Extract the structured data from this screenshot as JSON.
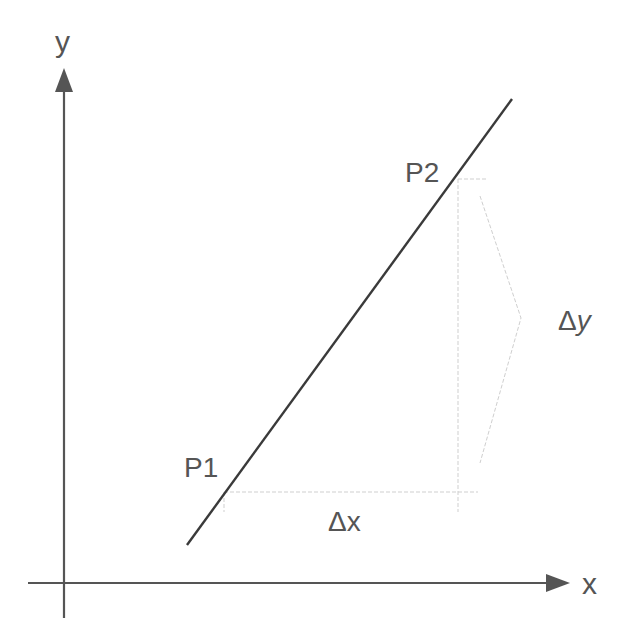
{
  "diagram": {
    "axes": {
      "x_label": "x",
      "y_label": "y"
    },
    "points": [
      {
        "label": "P1"
      },
      {
        "label": "P2"
      }
    ],
    "deltas": {
      "dx_label": "Δx",
      "dy_label_delta": "Δ",
      "dy_label_var": "y"
    },
    "colors": {
      "axis": "#555555",
      "line": "#3a3a3a",
      "guide": "#cfcfcf",
      "text": "#555555"
    }
  }
}
